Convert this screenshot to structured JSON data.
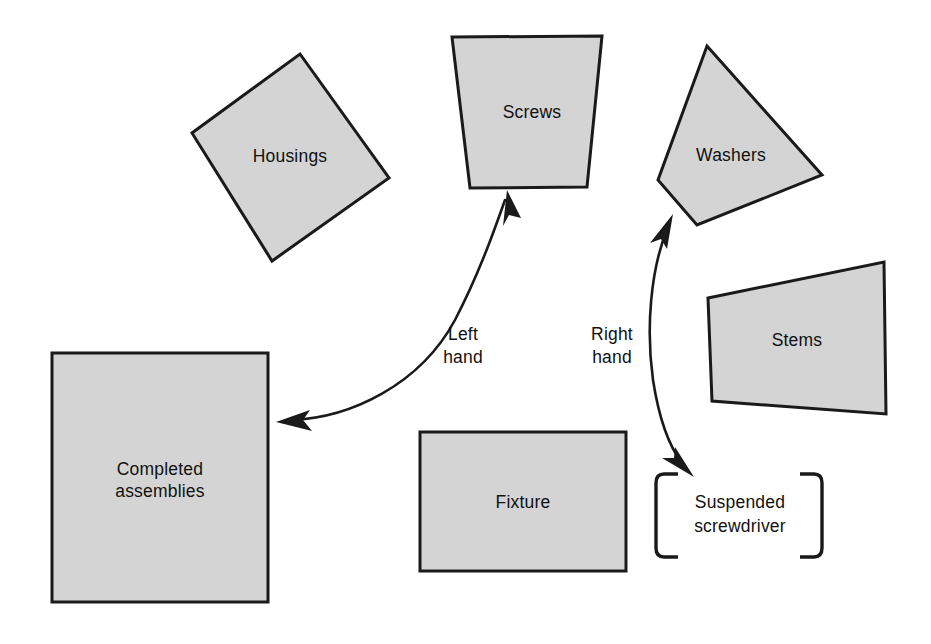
{
  "diagram": {
    "background_color": "#ffffff",
    "shape_fill_color": "#d4d4d4",
    "shape_stroke_color": "#1a1a1a",
    "text_color": "#111111",
    "shapes": [
      {
        "id": "housings",
        "label": "Housings",
        "kind": "rotated-square",
        "points": "300,54 389,178 272,261 192,133",
        "label_x": 290,
        "label_y": 157
      },
      {
        "id": "screws",
        "label": "Screws",
        "kind": "trapezoid",
        "points": "452,37 602,36 587,187 470,188",
        "label_x": 532,
        "label_y": 113
      },
      {
        "id": "washers",
        "label": "Washers",
        "kind": "quadrilateral",
        "points": "707,46 822,175 697,225 658,180",
        "label_x": 731,
        "label_y": 156
      },
      {
        "id": "stems",
        "label": "Stems",
        "kind": "quadrilateral",
        "points": "708,298 884,262 886,414 712,401",
        "label_x": 797,
        "label_y": 341
      },
      {
        "id": "completed-assemblies",
        "label": "Completed\nassemblies",
        "label_line1": "Completed",
        "label_line2": "assemblies",
        "kind": "rectangle",
        "points": "52,353 268,353 268,602 52,602",
        "label_x": 160,
        "label_y": 480
      },
      {
        "id": "fixture",
        "label": "Fixture",
        "kind": "rectangle",
        "points": "420,432 626,432 626,571 420,571",
        "label_x": 523,
        "label_y": 503
      }
    ],
    "bracketed_item": {
      "id": "suspended-screwdriver",
      "label_line1": "Suspended",
      "label_line2": "screwdriver",
      "label_x": 740,
      "label_y": 515,
      "left_bracket_x": 656,
      "right_bracket_x": 822,
      "bracket_top_y": 473,
      "bracket_bottom_y": 558
    },
    "flows": [
      {
        "id": "left-hand",
        "label_line1": "Left",
        "label_line2": "hand",
        "label_x": 463,
        "label_y": 344,
        "from": "completed-assemblies",
        "to": "screws",
        "double_headed": true
      },
      {
        "id": "right-hand",
        "label_line1": "Right",
        "label_line2": "hand",
        "label_x": 612,
        "label_y": 344,
        "from": "washers",
        "to": "suspended-screwdriver",
        "double_headed": true
      }
    ]
  }
}
